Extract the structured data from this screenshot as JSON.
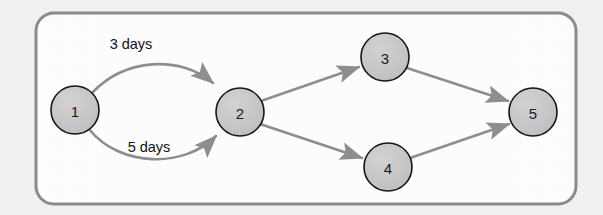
{
  "figure": {
    "type": "directed-graph",
    "background_color": "#f3f3f3",
    "panel": {
      "fill": "#ffffff",
      "border_color": "#8c8c8c",
      "x": 36,
      "y": 13,
      "width": 540,
      "height": 191,
      "corner_radius": 18,
      "border_width": 3
    },
    "node_style": {
      "fill": "#c7c7c7",
      "stroke": "#161616",
      "stroke_width": 1.6,
      "radius": 24,
      "text_color": "#1a1a1a"
    },
    "edge_style": {
      "stroke": "#8f8f8f",
      "stroke_width": 2.6,
      "arrow_fill": "#8f8f8f"
    }
  },
  "nodes": [
    {
      "id": "1",
      "label": "1",
      "cx": 75,
      "cy": 110,
      "r": 24
    },
    {
      "id": "2",
      "label": "2",
      "cx": 240,
      "cy": 112,
      "r": 24
    },
    {
      "id": "3",
      "label": "3",
      "cx": 385,
      "cy": 57,
      "r": 24
    },
    {
      "id": "4",
      "label": "4",
      "cx": 388,
      "cy": 167,
      "r": 24
    },
    {
      "id": "5",
      "label": "5",
      "cx": 533,
      "cy": 112,
      "r": 24
    }
  ],
  "edges": [
    {
      "id": "e1-2-upper",
      "from": "1",
      "to": "2",
      "shape": "curve",
      "label": "3 days",
      "label_x": 131,
      "label_y": 44
    },
    {
      "id": "e1-2-lower",
      "from": "1",
      "to": "2",
      "shape": "curve",
      "label": "5 days",
      "label_x": 149,
      "label_y": 147
    },
    {
      "id": "e2-3",
      "from": "2",
      "to": "3",
      "shape": "straight",
      "label": ""
    },
    {
      "id": "e2-4",
      "from": "2",
      "to": "4",
      "shape": "straight",
      "label": ""
    },
    {
      "id": "e3-5",
      "from": "3",
      "to": "5",
      "shape": "straight",
      "label": ""
    },
    {
      "id": "e4-5",
      "from": "4",
      "to": "5",
      "shape": "straight",
      "label": ""
    }
  ],
  "labels": {
    "edge_upper": "3 days",
    "edge_lower": "5 days",
    "node_1": "1",
    "node_2": "2",
    "node_3": "3",
    "node_4": "4",
    "node_5": "5"
  }
}
